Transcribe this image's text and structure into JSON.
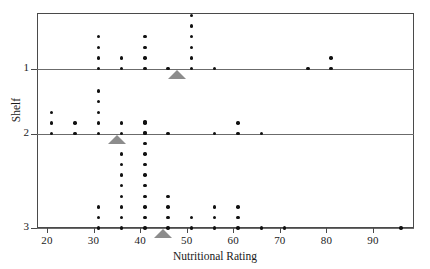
{
  "chart_data": {
    "type": "scatter",
    "title": "",
    "xlabel": "Nutritional Rating",
    "ylabel": "Shelf",
    "xlim": [
      16,
      97
    ],
    "xticks": [
      20,
      30,
      40,
      50,
      60,
      70,
      80,
      90
    ],
    "xtick_labels": [
      "20",
      "30",
      "40",
      "50",
      "60",
      "70",
      "80",
      "90"
    ],
    "yticks": [
      1,
      2,
      3
    ],
    "ytick_labels": [
      "1",
      "2",
      "3"
    ],
    "grid": false,
    "legend": false,
    "series": [
      {
        "name": "Shelf 1",
        "shelf": 1,
        "bins": [
          {
            "rating": 31,
            "count": 4
          },
          {
            "rating": 36,
            "count": 2
          },
          {
            "rating": 41,
            "count": 4
          },
          {
            "rating": 46,
            "count": 1
          },
          {
            "rating": 51,
            "count": 6
          },
          {
            "rating": 56,
            "count": 1
          },
          {
            "rating": 76,
            "count": 1
          },
          {
            "rating": 81,
            "count": 2
          }
        ],
        "mean": 48
      },
      {
        "name": "Shelf 2",
        "shelf": 2,
        "bins": [
          {
            "rating": 21,
            "count": 3
          },
          {
            "rating": 26,
            "count": 2
          },
          {
            "rating": 31,
            "count": 5
          },
          {
            "rating": 36,
            "count": 2
          },
          {
            "rating": 41,
            "count": 2
          },
          {
            "rating": 46,
            "count": 1
          },
          {
            "rating": 56,
            "count": 1
          },
          {
            "rating": 61,
            "count": 2
          },
          {
            "rating": 66,
            "count": 1
          }
        ],
        "mean": 35
      },
      {
        "name": "Shelf 3",
        "shelf": 3,
        "bins": [
          {
            "rating": 31,
            "count": 3
          },
          {
            "rating": 36,
            "count": 8
          },
          {
            "rating": 41,
            "count": 11
          },
          {
            "rating": 46,
            "count": 4
          },
          {
            "rating": 51,
            "count": 2
          },
          {
            "rating": 56,
            "count": 3
          },
          {
            "rating": 61,
            "count": 3
          },
          {
            "rating": 66,
            "count": 1
          },
          {
            "rating": 71,
            "count": 1
          },
          {
            "rating": 96,
            "count": 1
          }
        ],
        "mean": 45
      }
    ],
    "mean_markers": [
      {
        "shelf": 1,
        "rating": 48
      },
      {
        "shelf": 2,
        "rating": 35
      },
      {
        "shelf": 3,
        "rating": 45
      }
    ],
    "colors": {
      "dot": "#111111",
      "mean_marker": "#8c8c8c",
      "frame": "#4a4a4a",
      "shelf_line": "#6b6b6b",
      "background": "#ffffff"
    }
  }
}
